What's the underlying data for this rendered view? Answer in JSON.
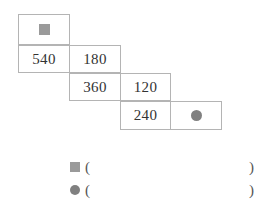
{
  "worksheet": {
    "title": "Staircase number grid",
    "background_color": "#ffffff",
    "border_color": "#b4b4b4",
    "text_color": "#333333"
  },
  "markers": {
    "square": {
      "name": "square-marker",
      "shape": "square",
      "color": "#9a9a9a",
      "label": ""
    },
    "circle": {
      "name": "circle-marker",
      "shape": "circle",
      "color": "#808080",
      "label": ""
    }
  },
  "grid": {
    "rows": [
      {
        "row_index": 1,
        "cells": [
          {
            "col_index": 1,
            "content": "",
            "content_type": "square-marker",
            "x": 18,
            "y": 14,
            "w": 52,
            "h": 31
          }
        ]
      },
      {
        "row_index": 2,
        "cells": [
          {
            "col_index": 1,
            "content": "540",
            "content_type": "number",
            "x": 18,
            "y": 45,
            "w": 52,
            "h": 28
          },
          {
            "col_index": 2,
            "content": "180",
            "content_type": "number",
            "x": 69,
            "y": 45,
            "w": 52,
            "h": 28
          }
        ]
      },
      {
        "row_index": 3,
        "cells": [
          {
            "col_index": 2,
            "content": "360",
            "content_type": "number",
            "x": 69,
            "y": 73,
            "w": 52,
            "h": 28
          },
          {
            "col_index": 3,
            "content": "120",
            "content_type": "number",
            "x": 120,
            "y": 73,
            "w": 51,
            "h": 28
          }
        ]
      },
      {
        "row_index": 4,
        "cells": [
          {
            "col_index": 3,
            "content": "240",
            "content_type": "number",
            "x": 120,
            "y": 101,
            "w": 51,
            "h": 29
          },
          {
            "col_index": 4,
            "content": "",
            "content_type": "circle-marker",
            "x": 170,
            "y": 101,
            "w": 52,
            "h": 29
          }
        ]
      }
    ]
  },
  "legend": {
    "rows": [
      {
        "marker": "square",
        "open_paren": "(",
        "answer": "",
        "close_paren": ")",
        "y": 157
      },
      {
        "marker": "circle",
        "open_paren": "(",
        "answer": "",
        "close_paren": ")",
        "y": 180
      }
    ]
  }
}
